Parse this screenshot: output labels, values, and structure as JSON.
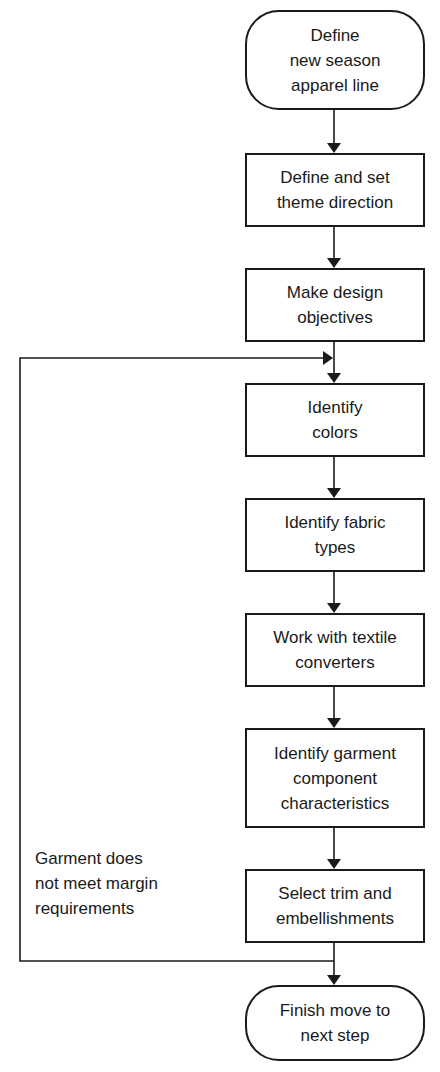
{
  "diagram": {
    "type": "flowchart",
    "nodes": [
      {
        "id": "start",
        "shape": "terminal",
        "lines": [
          "Define",
          "new season",
          "apparel line"
        ]
      },
      {
        "id": "theme",
        "shape": "process",
        "lines": [
          "Define and set",
          "theme direction"
        ]
      },
      {
        "id": "objectives",
        "shape": "process",
        "lines": [
          "Make design",
          "objectives"
        ]
      },
      {
        "id": "colors",
        "shape": "process",
        "lines": [
          "Identify",
          "colors"
        ]
      },
      {
        "id": "fabric",
        "shape": "process",
        "lines": [
          "Identify fabric",
          "types"
        ]
      },
      {
        "id": "converters",
        "shape": "process",
        "lines": [
          "Work with textile",
          "converters"
        ]
      },
      {
        "id": "garment",
        "shape": "process",
        "lines": [
          "Identify garment",
          "component",
          "characteristics"
        ]
      },
      {
        "id": "trim",
        "shape": "process",
        "lines": [
          "Select trim and",
          "embellishments"
        ]
      },
      {
        "id": "finish",
        "shape": "terminal",
        "lines": [
          "Finish move to",
          "next step"
        ]
      }
    ],
    "loop_note": {
      "lines": [
        "Garment does",
        "not meet margin",
        "requirements"
      ]
    },
    "edges": [
      [
        "start",
        "theme"
      ],
      [
        "theme",
        "objectives"
      ],
      [
        "objectives",
        "colors"
      ],
      [
        "colors",
        "fabric"
      ],
      [
        "fabric",
        "converters"
      ],
      [
        "converters",
        "garment"
      ],
      [
        "garment",
        "trim"
      ],
      [
        "trim",
        "finish"
      ],
      [
        "trim",
        "colors",
        "loop: Garment does not meet margin requirements"
      ]
    ]
  }
}
